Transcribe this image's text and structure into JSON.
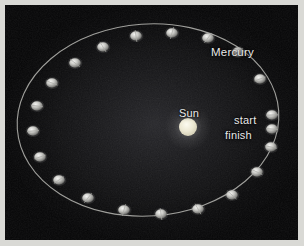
{
  "figure": {
    "frame_color": "#d9d9d5",
    "sky_color": "#060607"
  },
  "labels": {
    "mercury": "Mercury",
    "sun": "Sun",
    "start": "start",
    "finish": "finish"
  },
  "sun": {
    "cx": 183,
    "cy": 122,
    "r": 9,
    "color": "#ece9d8"
  },
  "orbit": {
    "cx": 143,
    "cy": 115,
    "rx": 131,
    "ry": 96,
    "rotation": -4,
    "stroke": "#b9b9b4",
    "stroke_width": 1.1
  },
  "chart_data": {
    "type": "scatter",
    "xlabel": "",
    "ylabel": "",
    "annotations": [
      "Mercury",
      "Sun",
      "start",
      "finish"
    ],
    "legend": [],
    "grid": false,
    "series": [
      {
        "name": "Mercury positions",
        "points": [
          {
            "x": 267,
            "y": 110,
            "label": "start"
          },
          {
            "x": 267,
            "y": 124,
            "label": "finish"
          },
          {
            "x": 255,
            "y": 74,
            "label": ""
          },
          {
            "x": 233,
            "y": 47,
            "label": ""
          },
          {
            "x": 203,
            "y": 33,
            "label": ""
          },
          {
            "x": 167,
            "y": 28,
            "label": ""
          },
          {
            "x": 131,
            "y": 31,
            "label": ""
          },
          {
            "x": 98,
            "y": 42,
            "label": ""
          },
          {
            "x": 70,
            "y": 58,
            "label": ""
          },
          {
            "x": 47,
            "y": 78,
            "label": ""
          },
          {
            "x": 32,
            "y": 101,
            "label": ""
          },
          {
            "x": 28,
            "y": 126,
            "label": ""
          },
          {
            "x": 35,
            "y": 152,
            "label": ""
          },
          {
            "x": 54,
            "y": 175,
            "label": ""
          },
          {
            "x": 83,
            "y": 193,
            "label": ""
          },
          {
            "x": 119,
            "y": 205,
            "label": ""
          },
          {
            "x": 156,
            "y": 209,
            "label": ""
          },
          {
            "x": 193,
            "y": 204,
            "label": ""
          },
          {
            "x": 227,
            "y": 190,
            "label": ""
          },
          {
            "x": 252,
            "y": 167,
            "label": ""
          },
          {
            "x": 266,
            "y": 142,
            "label": ""
          }
        ]
      }
    ]
  }
}
